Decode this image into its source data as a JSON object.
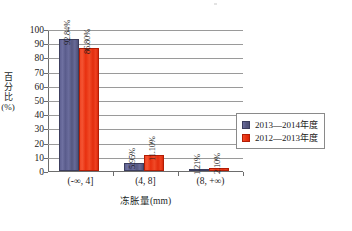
{
  "chart_data": {
    "type": "bar",
    "title": "",
    "subtitle": "",
    "xlabel": "冻胀量(mm)",
    "ylabel": "百分比(%)",
    "categories": [
      "(-∞, 4]",
      "(4, 8]",
      "(8, +∞)"
    ],
    "series": [
      {
        "name": "2013—2014年度",
        "color": "#5a5c8c",
        "values": [
          92.84,
          5.95,
          1.21
        ],
        "labels": [
          "92.84%",
          "5.95%",
          "1.21%"
        ]
      },
      {
        "name": "2012—2013年度",
        "color": "#e8300f",
        "values": [
          86.8,
          11.1,
          2.1
        ],
        "labels": [
          "86.80%",
          "11.10%",
          "2.10%"
        ]
      }
    ],
    "ylim": [
      0,
      100
    ],
    "yticks": [
      0,
      10,
      20,
      30,
      40,
      50,
      60,
      70,
      80,
      90,
      100
    ],
    "ytick_labels": [
      "0",
      "10",
      "20",
      "30",
      "40",
      "50",
      "60",
      "70",
      "80",
      "90",
      "100"
    ],
    "grid": "horizontal",
    "legend_position": "right"
  },
  "legend": {
    "entries": [
      {
        "label": "2013—2014年度",
        "swatch": "series-0-swatch"
      },
      {
        "label": "2012—2013年度",
        "swatch": "series-1-swatch"
      }
    ]
  }
}
